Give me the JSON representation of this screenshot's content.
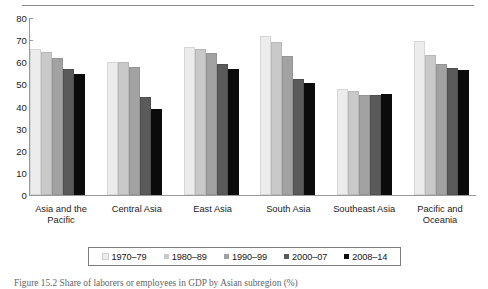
{
  "caption": "Figure 15.2  Share of laborers or employees in GDP by Asian subregion (%)",
  "chart_data": {
    "type": "bar",
    "title": "",
    "xlabel": "",
    "ylabel": "",
    "ylim": [
      0,
      80
    ],
    "yticks": [
      0,
      10,
      20,
      30,
      40,
      50,
      60,
      70,
      80
    ],
    "grid": false,
    "legend_position": "bottom",
    "categories": [
      "Asia and the Pacific",
      "Central Asia",
      "East Asia",
      "South Asia",
      "Southeast Asia",
      "Pacific and Oceania"
    ],
    "series": [
      {
        "name": "1970–79",
        "color": "#ececec",
        "values": [
          66.0,
          60.0,
          67.0,
          72.0,
          48.0,
          69.5
        ]
      },
      {
        "name": "1980–89",
        "color": "#c9c9c9",
        "values": [
          64.5,
          60.0,
          66.0,
          69.0,
          47.0,
          63.5
        ]
      },
      {
        "name": "1990–99",
        "color": "#a2a2a2",
        "values": [
          62.0,
          58.0,
          64.0,
          63.0,
          45.0,
          59.0
        ]
      },
      {
        "name": "2000–07",
        "color": "#5a5a5a",
        "values": [
          57.0,
          44.5,
          59.0,
          52.5,
          45.0,
          57.5
        ]
      },
      {
        "name": "2008–14",
        "color": "#0b0b0b",
        "values": [
          54.5,
          39.0,
          57.0,
          50.5,
          45.5,
          56.5
        ]
      }
    ]
  }
}
